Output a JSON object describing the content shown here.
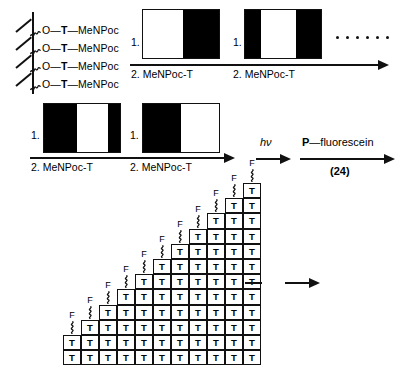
{
  "diagram": {
    "support": {
      "linker_count": 4,
      "chain_label_parts": [
        "O",
        "T",
        "MeNPoc"
      ],
      "chain_label": "O—T—MeNPoc",
      "linker_icon": "squiggle-linker-icon",
      "support_icon": "solid-support-line-icon"
    },
    "steps": [
      {
        "id": "step-1",
        "number_label": "1.",
        "reagent_label": "2. MeNPoc-T",
        "mask_name": "photolithographic-mask",
        "mask_segments": [
          {
            "tone": "white",
            "width_pct": 52
          },
          {
            "tone": "black",
            "width_pct": 48
          }
        ]
      },
      {
        "id": "step-2",
        "number_label": "1.",
        "reagent_label": "2. MeNPoc-T",
        "mask_name": "photolithographic-mask",
        "mask_segments": [
          {
            "tone": "black",
            "width_pct": 21
          },
          {
            "tone": "white",
            "width_pct": 46
          },
          {
            "tone": "black",
            "width_pct": 33
          }
        ]
      },
      {
        "id": "step-3",
        "number_label": "1.",
        "reagent_label": "2. MeNPoc-T",
        "mask_name": "photolithographic-mask",
        "mask_segments": [
          {
            "tone": "black",
            "width_pct": 44
          },
          {
            "tone": "white",
            "width_pct": 40
          },
          {
            "tone": "black",
            "width_pct": 16
          }
        ]
      },
      {
        "id": "step-4",
        "number_label": "1.",
        "reagent_label": "2. MeNPoc-T",
        "mask_name": "photolithographic-mask",
        "mask_segments": [
          {
            "tone": "black",
            "width_pct": 50
          },
          {
            "tone": "white",
            "width_pct": 50
          }
        ]
      }
    ],
    "continuation": {
      "dots_icon": "ellipsis-dots-icon",
      "dot_count": 6
    },
    "final_reactions": [
      {
        "id": "photolysis",
        "above_label": "hν",
        "below_label": "",
        "arrow_icon": "reaction-arrow-icon"
      },
      {
        "id": "labeling",
        "above_label": "P—fluorescein",
        "below_label": "(24)",
        "arrow_icon": "reaction-arrow-icon"
      }
    ],
    "array": {
      "name": "staircase-oligonucleotide-array",
      "cell_label": "T",
      "cap_label": "F",
      "cap_linker_icon": "squiggle-linker-icon",
      "columns": 11,
      "column_heights": [
        2,
        3,
        4,
        5,
        6,
        7,
        8,
        9,
        10,
        11,
        12
      ],
      "cell_width": 18,
      "cell_height": 15.2
    },
    "array_result": {
      "dash_icon": "dash-icon",
      "arrow_icon": "reaction-arrow-icon"
    },
    "colors": {
      "ink": "#000000",
      "paper": "#ffffff",
      "mask_open": "#ffffff",
      "mask_blocked": "#000000"
    }
  }
}
